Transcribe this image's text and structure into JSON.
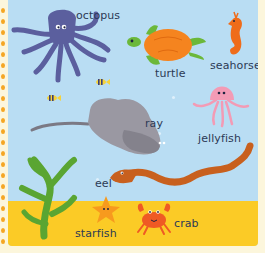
{
  "page": {
    "colors": {
      "water": "#b9ddf3",
      "sand": "#fbcb26",
      "border": "#fcf6dc",
      "border_dots": "#f5a623",
      "label_text": "#2c3a55"
    }
  },
  "creatures": [
    {
      "id": "octopus",
      "label": "octopus",
      "color": "#5b5f9e"
    },
    {
      "id": "turtle",
      "label": "turtle",
      "color": "#f5841f"
    },
    {
      "id": "seahorse",
      "label": "seahorse",
      "color": "#ef6c1a"
    },
    {
      "id": "ray",
      "label": "ray",
      "color": "#9a98a2"
    },
    {
      "id": "jellyfish",
      "label": "jellyfish",
      "color": "#f39bb5"
    },
    {
      "id": "eel",
      "label": "eel",
      "color": "#c8601e"
    },
    {
      "id": "starfish",
      "label": "starfish",
      "color": "#f79a1e"
    },
    {
      "id": "crab",
      "label": "crab",
      "color": "#ef5a24"
    }
  ],
  "decorations": [
    {
      "id": "seaweed",
      "color": "#5aa532"
    },
    {
      "id": "small-fish",
      "count": 2
    }
  ]
}
